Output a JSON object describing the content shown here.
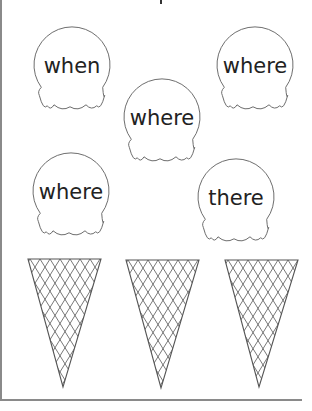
{
  "worksheet": {
    "title_fragment_visible": true,
    "scoops": [
      {
        "word": "when"
      },
      {
        "word": "where"
      },
      {
        "word": "where"
      },
      {
        "word": "where"
      },
      {
        "word": "there"
      }
    ],
    "cones": [
      {
        "label": "cone 1"
      },
      {
        "label": "cone 2"
      },
      {
        "label": "cone 3"
      }
    ],
    "colors": {
      "text": "#222222",
      "outline": "#6e6e6e",
      "rule": "#8a8a8a"
    }
  }
}
